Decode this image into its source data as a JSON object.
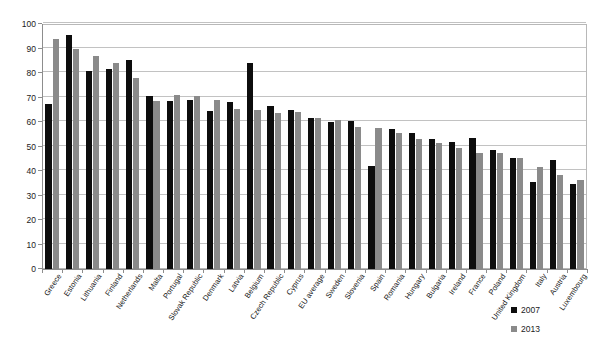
{
  "chart_data": {
    "type": "bar",
    "title": "",
    "subtitle": "",
    "xlabel": "",
    "ylabel": "",
    "ylim": [
      0,
      100
    ],
    "y_ticks": [
      0,
      10,
      20,
      30,
      40,
      50,
      60,
      70,
      80,
      90,
      100
    ],
    "grid": true,
    "legend_position": "bottom-right",
    "categories": [
      "Greece",
      "Estonia",
      "Lithuania",
      "Finland",
      "Netherlands",
      "Malta",
      "Portugal",
      "Slovak Republic",
      "Denmark",
      "Latvia",
      "Belgium",
      "Czech Republic",
      "Cyprus",
      "EU average",
      "Sweden",
      "Slovenia",
      "Spain",
      "Romania",
      "Hungary",
      "Bulgaria",
      "Ireland",
      "France",
      "Poland",
      "United Kingdom",
      "Italy",
      "Austria",
      "Luxembourg"
    ],
    "series": [
      {
        "name": "2007",
        "color": "#0d0d0d",
        "values": [
          67.5,
          95.5,
          81,
          81.5,
          85.5,
          70.5,
          68.5,
          69,
          64.5,
          68,
          84,
          66.5,
          65,
          61.5,
          60,
          60.5,
          42,
          57,
          55.5,
          53,
          52,
          53.5,
          48.5,
          45.5,
          35.5,
          44.5,
          34.5
        ]
      },
      {
        "name": "2013",
        "color": "#8a8a8a",
        "values": [
          94,
          90,
          87,
          84,
          78,
          68.5,
          71,
          70.5,
          69,
          65.5,
          65,
          63.5,
          64,
          61.5,
          61,
          58,
          57.5,
          55.5,
          53,
          51.5,
          49.5,
          47.5,
          47.5,
          45.5,
          41.5,
          38.5,
          36.5
        ]
      }
    ]
  },
  "legend": {
    "items": [
      {
        "label": "2007",
        "swatch": "legend-swatch-black"
      },
      {
        "label": "2013",
        "swatch": "legend-swatch-gray"
      }
    ]
  }
}
